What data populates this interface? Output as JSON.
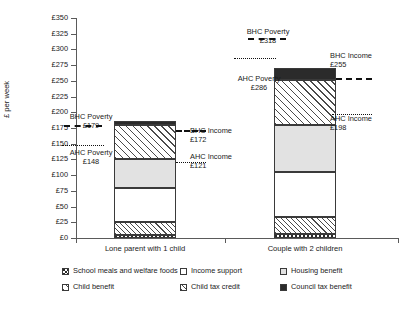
{
  "chart_data": {
    "type": "bar",
    "title": "",
    "xlabel": "",
    "ylabel": "£ per week",
    "ylim": [
      0,
      350
    ],
    "ytick_step": 25,
    "grid": false,
    "legend_position": "bottom",
    "stacked": true,
    "categories": [
      "Lone parent with 1 child",
      "Couple with 2 children"
    ],
    "ytick_labels": [
      "£0",
      "£25",
      "£50",
      "£75",
      "£100",
      "£125",
      "£150",
      "£175",
      "£200",
      "£225",
      "£250",
      "£275",
      "£300",
      "£325",
      "£350"
    ],
    "ytick_values": [
      0,
      25,
      50,
      75,
      100,
      125,
      150,
      175,
      200,
      225,
      250,
      275,
      300,
      325,
      350
    ],
    "series": [
      {
        "name": "School meals and welfare foods",
        "pattern": "school",
        "values": [
          4,
          7
        ]
      },
      {
        "name": "Child tax credit",
        "pattern": "ctc",
        "values": [
          21,
          26
        ]
      },
      {
        "name": "Income support",
        "pattern": "is",
        "values": [
          55,
          72
        ]
      },
      {
        "name": "Housing benefit",
        "pattern": "hb",
        "values": [
          45,
          75
        ]
      },
      {
        "name": "Child benefit",
        "pattern": "cb",
        "values": [
          54,
          72
        ]
      },
      {
        "name": "Council tax benefit",
        "pattern": "ctb",
        "values": [
          7,
          18
        ]
      }
    ],
    "totals": [
      186,
      270
    ],
    "annotations": [
      {
        "id": "bhc-poverty-1",
        "group": "Lone parent with 1 child",
        "label": "BHC Poverty",
        "amount": "£179",
        "value": 179,
        "line": "dashed",
        "side": "left"
      },
      {
        "id": "ahc-poverty-1",
        "group": "Lone parent with 1 child",
        "label": "AHC Poverty",
        "amount": "£148",
        "value": 148,
        "line": "dotted",
        "side": "left"
      },
      {
        "id": "bhc-income-1",
        "group": "Lone parent with 1 child",
        "label": "BHC Income",
        "amount": "£172",
        "value": 172,
        "line": "dashed",
        "side": "right"
      },
      {
        "id": "ahc-income-1",
        "group": "Lone parent with 1 child",
        "label": "AHC Income",
        "amount": "£121",
        "value": 121,
        "line": "dotted",
        "side": "right"
      },
      {
        "id": "bhc-poverty-2",
        "group": "Couple with 2 children",
        "label": "BHC Poverty",
        "amount": "£318",
        "value": 318,
        "line": "dashed",
        "side": "left"
      },
      {
        "id": "ahc-poverty-2",
        "group": "Couple with 2 children",
        "label": "AHC Poverty",
        "amount": "£286",
        "value": 286,
        "line": "dotted",
        "side": "left"
      },
      {
        "id": "bhc-income-2",
        "group": "Couple with 2 children",
        "label": "BHC Income",
        "amount": "£255",
        "value": 255,
        "line": "dashed",
        "side": "right"
      },
      {
        "id": "ahc-income-2",
        "group": "Couple with 2 children",
        "label": "AHC Income",
        "amount": "£198",
        "value": 198,
        "line": "dotted",
        "side": "right"
      }
    ],
    "legend": [
      {
        "label": "School meals and welfare foods",
        "pattern": "school"
      },
      {
        "label": "Child benefit",
        "pattern": "cb"
      },
      {
        "label": "Income support",
        "pattern": "is"
      },
      {
        "label": "Child tax credit",
        "pattern": "ctc"
      },
      {
        "label": "Housing benefit",
        "pattern": "hb"
      },
      {
        "label": "Council tax benefit",
        "pattern": "ctb"
      }
    ],
    "colors": {
      "dark": "#2b2b2b",
      "light_gray": "#e2e2e2",
      "white": "#ffffff",
      "axis": "#5a5a5a",
      "text": "#1a1a1a"
    }
  }
}
